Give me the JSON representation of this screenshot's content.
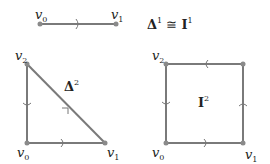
{
  "top": {
    "edge": {
      "v0": "v",
      "v0_sub": "0",
      "v1": "v",
      "v1_sub": "1"
    },
    "equation": {
      "lhs": "Δ",
      "lhs_sup": "1",
      "op": "≅",
      "rhs": "I",
      "rhs_sup": "1"
    }
  },
  "simplex": {
    "label": "Δ",
    "label_sup": "2",
    "vertices": [
      {
        "name": "v",
        "sub": "0"
      },
      {
        "name": "v",
        "sub": "1"
      },
      {
        "name": "v",
        "sub": "2"
      }
    ]
  },
  "cube": {
    "label": "I",
    "label_sup": "2",
    "vertices": [
      {
        "name": "v",
        "sub": "0"
      },
      {
        "name": "v",
        "sub": "1"
      },
      {
        "name": "v",
        "sub": "2"
      }
    ]
  },
  "colors": {
    "edge": "#7a7a7a",
    "vertex": "#8a8a8a",
    "text": "#222222"
  }
}
